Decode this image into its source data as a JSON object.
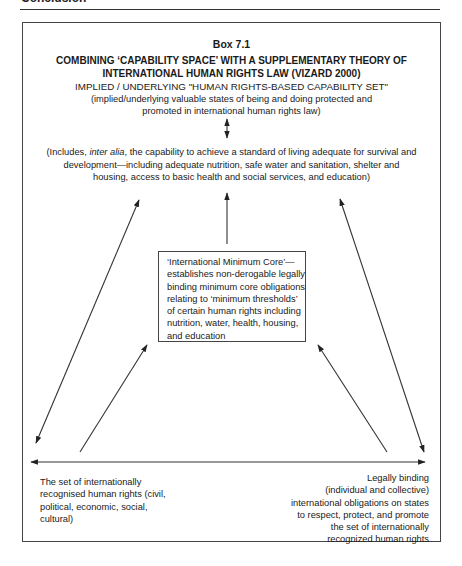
{
  "page": {
    "running_head": "Conclusion"
  },
  "box": {
    "number": "Box 7.1",
    "title_line1": "COMBINING ‘CAPABILITY SPACE’ WITH A SUPPLEMENTARY THEORY OF",
    "title_line2": "INTERNATIONAL HUMAN RIGHTS LAW (VIZARD 2000)"
  },
  "capability_set": {
    "heading": "IMPLIED / UNDERLYING \"HUMAN RIGHTS-BASED CAPABILITY SET\"",
    "subtitle": "(implied/underlying valuable states of being and doing protected and promoted in international human rights law)",
    "includes_prefix": "(Includes, ",
    "includes_italic": "inter alia",
    "includes_rest": ", the capability to achieve a standard of living adequate for survival and development—including adequate nutrition, safe water and sanitation, shelter and housing, access to basic health and social services, and education)"
  },
  "minimum_core": {
    "text": "‘International Minimum Core’— establishes non-derogable legally binding minimum core obligations relating to ‘minimum thresholds’ of certain human rights including nutrition, water, health, housing, and education"
  },
  "bottom_left": {
    "text": "The set of internationally recognised human rights (civil, political, economic, social, cultural)"
  },
  "bottom_right": {
    "lines": [
      "Legally binding",
      "(individual and collective)",
      "international obligations on states",
      "to respect, protect, and promote",
      "the set of internationally",
      "recognized  human rights"
    ]
  },
  "arrows": [
    {
      "name": "capability-set-to-includes",
      "type": "double",
      "from": [
        227,
        119
      ],
      "to": [
        227,
        138
      ]
    },
    {
      "name": "core-to-includes",
      "type": "single",
      "from": [
        227,
        244
      ],
      "to": [
        227,
        193
      ]
    },
    {
      "name": "left-outer",
      "type": "double",
      "from": [
        36,
        443
      ],
      "to": [
        139,
        200
      ]
    },
    {
      "name": "left-rights-to-core",
      "type": "single",
      "from": [
        80,
        452
      ],
      "to": [
        147,
        345
      ]
    },
    {
      "name": "right-outer",
      "type": "double",
      "from": [
        424,
        452
      ],
      "to": [
        340,
        199
      ]
    },
    {
      "name": "right-obligations-to-core",
      "type": "single",
      "from": [
        387,
        452
      ],
      "to": [
        318,
        345
      ]
    },
    {
      "name": "bottom-horizontal",
      "type": "double",
      "from": [
        31,
        462
      ],
      "to": [
        425,
        462
      ]
    }
  ],
  "colors": {
    "ink": "#1a1a1a",
    "rule": "#444444",
    "background": "#ffffff"
  }
}
